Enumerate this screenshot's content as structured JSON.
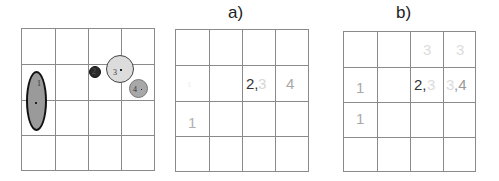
{
  "panels": {
    "source": {
      "title": "",
      "grid": {
        "rows": 4,
        "cols": 4
      },
      "shapes": [
        {
          "id": "1",
          "label": "1",
          "type": "ellipse",
          "fill": "#9a9a9a",
          "stroke": "#111111"
        },
        {
          "id": "2",
          "label": "2",
          "type": "circle",
          "fill": "#2a2a2a",
          "stroke": "#111111"
        },
        {
          "id": "3",
          "label": "3",
          "type": "circle",
          "fill": "#dcdcdc",
          "stroke": "#444444"
        },
        {
          "id": "4",
          "label": "4",
          "type": "circle",
          "fill": "#a8a8a8",
          "stroke": "#777777"
        }
      ]
    },
    "a": {
      "title": "a)",
      "grid": {
        "rows": 4,
        "cols": 4
      },
      "cells": [
        {
          "row": 1,
          "col": 0,
          "text": "1",
          "color": "#eeeeee"
        },
        {
          "row": 1,
          "col": 2,
          "text": "2,",
          "color": "#333333"
        },
        {
          "row": 1,
          "col": 2,
          "text": "3",
          "color": "#d6d6d6"
        },
        {
          "row": 1,
          "col": 3,
          "text": "4",
          "color": "#a8a8a8"
        },
        {
          "row": 2,
          "col": 0,
          "text": "1",
          "color": "#b0b0b0"
        }
      ]
    },
    "b": {
      "title": "b)",
      "grid": {
        "rows": 4,
        "cols": 4
      },
      "cells": [
        {
          "row": 0,
          "col": 2,
          "text": "3",
          "color": "#dcdcdc"
        },
        {
          "row": 0,
          "col": 3,
          "text": "3",
          "color": "#dcdcdc"
        },
        {
          "row": 1,
          "col": 0,
          "text": "1",
          "color": "#a8a8a8"
        },
        {
          "row": 1,
          "col": 2,
          "text": "2,",
          "color": "#333333"
        },
        {
          "row": 1,
          "col": 2,
          "text": "3",
          "color": "#dcdcdc"
        },
        {
          "row": 1,
          "col": 3,
          "text": "3",
          "color": "#dcdcdc"
        },
        {
          "row": 1,
          "col": 3,
          "text": ",4",
          "color": "#999999"
        },
        {
          "row": 2,
          "col": 0,
          "text": "1",
          "color": "#a8a8a8"
        }
      ]
    }
  }
}
